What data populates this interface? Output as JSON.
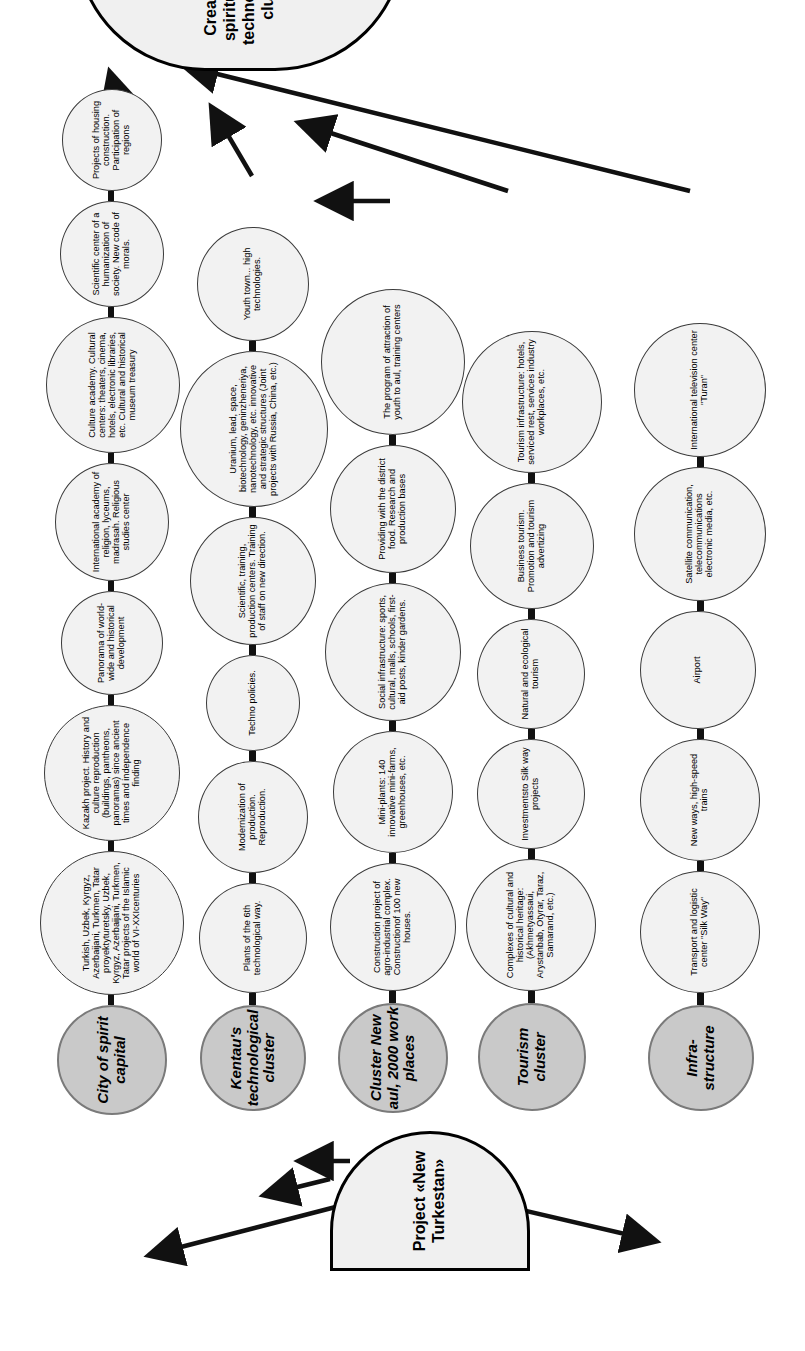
{
  "diagram": {
    "source": {
      "label": "Project «New Turkestan»",
      "shape": "rounded-terminal"
    },
    "goal": {
      "label": "Creation of spiritual and technological cluster",
      "shape": "rounded-terminal"
    },
    "colors": {
      "cluster_fill": "#c9c9c9",
      "node_fill": "#f2f2f2",
      "terminal_fill": "#f0f0f0",
      "line": "#111111"
    },
    "branches": [
      {
        "cluster": "City of spirit capital",
        "nodes": [
          "Turkish, Uzbek, Kyrgyz, Azerbaijani, Turkmen, Tatar proyektyturetsky, Uzbek, Kyrgyz, Azerbaijani, Turkmen, Tatar projects of the Islamic world of VI-XXIcenturies",
          "Kazakh project. History and culture reproduction (buildings, pantheons, panoramas) since ancient times and independence finding",
          "Panorama of world-wide and historical development",
          "International academy of religion, lyceums, madrasah. Religious studies center",
          "Culture academy. Cultural centers: theaters, cinema, hotels, electronic libraries, etc. Cultural and historical museum treasury",
          "Scientific center of a humanization of society. New code of morals.",
          "Projects of housing construction. Participation of regions"
        ]
      },
      {
        "cluster": "Kentau's technological cluster",
        "nodes": [
          "Plants of the 6th technological way.",
          "Modernization of production. Reproduction.",
          "Techno policies.",
          "Scientific, training, production centers. Training of staff on new direction.",
          "Uranium, lead, space, biotechnology, geninzheneriya, nanotechnology, etc. innovative and strategic structures (Joint projects with Russia, China, etc.)",
          "Youth town... high technologies."
        ]
      },
      {
        "cluster": "Cluster New aul, 2000 work places",
        "nodes": [
          "Construction project of agro-industrial complex. Constructionof 100 new houses.",
          "Mini-plants: 140 innovative mini-farms, greenhouses, etc.",
          "Social infrastructure: sports, cultural, malls, schools, first-aid posts, kinder gardens.",
          "Providing with the district food. Research and production bases",
          "The program of attraction of youth to aul, training centers"
        ]
      },
      {
        "cluster": "Tourism cluster",
        "nodes": [
          "Complexes of cultural and historical heritage: (Akhmetyassaui, Arystanbab, Otyrar, Taraz, Samarand, etc.)",
          "Investmentsto Silk way projects",
          "Natural and ecological tourism",
          "Business tourism. Promotion and tourism advertizing",
          "Tourism infrastructure: hotels, serviced rest, services industry workplaces, etc."
        ]
      },
      {
        "cluster": "Infra-structure",
        "nodes": [
          "Transport and logistic center \"Silk Way\"",
          "New ways, high-speed trains",
          "Airport",
          "Satellite communication, telecommunications electronic media, etc.",
          "International television center \"Turan\""
        ]
      }
    ]
  }
}
